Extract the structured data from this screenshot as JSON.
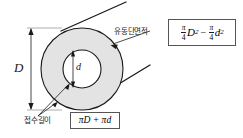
{
  "figure": {
    "colors": {
      "annulus_fill": "#e3e3e3",
      "inner_fill": "#ffffff",
      "stroke": "#1a1a1a",
      "box_border": "#555555",
      "background": "#ffffff"
    }
  },
  "dimensions": {
    "outer_diameter_label": "D",
    "inner_diameter_label": "d"
  },
  "annotations": {
    "flow_area": {
      "label": "유동단면적",
      "formula": {
        "term1_numerator": "π",
        "term1_denominator": "4",
        "term1_variable": "D",
        "term1_exponent": "2",
        "operator": "−",
        "term2_numerator": "π",
        "term2_denominator": "4",
        "term2_variable": "d",
        "term2_exponent": "2"
      }
    },
    "wetted_perimeter": {
      "label": "접수길이",
      "formula": "πD + πd"
    }
  }
}
